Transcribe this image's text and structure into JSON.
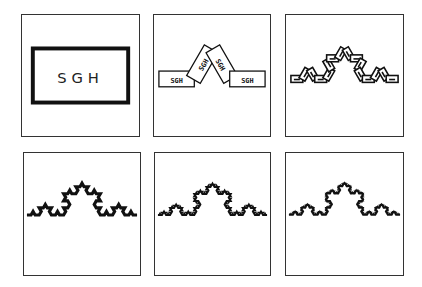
{
  "figure": {
    "ink_color": "#111111",
    "frame_color": "#333333",
    "label_text": "SGH",
    "panels": [
      {
        "id": "panel-1",
        "kind": "base-rectangle",
        "label": "SGH",
        "level": 0,
        "box": [
          21,
          14,
          119,
          123
        ]
      },
      {
        "id": "panel-2",
        "kind": "koch-labeled-rects",
        "label": "SGH",
        "level": 1,
        "box": [
          153,
          14,
          118,
          123
        ]
      },
      {
        "id": "panel-3",
        "kind": "koch-rects",
        "level": 2,
        "box": [
          285,
          14,
          119,
          123
        ]
      },
      {
        "id": "panel-4",
        "kind": "koch-curve",
        "level": 3,
        "stroke": 3.2,
        "box": [
          23,
          152,
          118,
          124
        ]
      },
      {
        "id": "panel-5",
        "kind": "koch-curve",
        "level": 4,
        "stroke": 2.0,
        "box": [
          154,
          152,
          117,
          124
        ]
      },
      {
        "id": "panel-6",
        "kind": "koch-curve",
        "level": 5,
        "stroke": 1.6,
        "box": [
          285,
          152,
          119,
          124
        ]
      }
    ]
  }
}
